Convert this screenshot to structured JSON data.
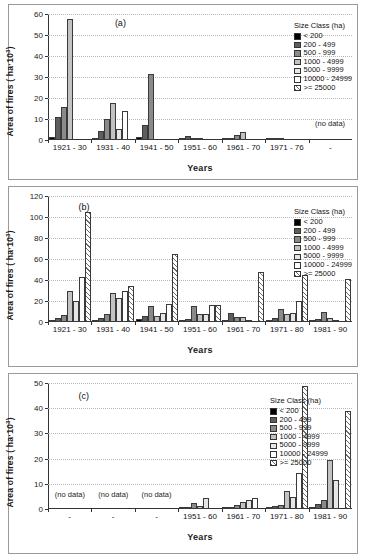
{
  "figure": {
    "xlabel": "Years",
    "ylabel_prefix": "Area of fires ( ha",
    "ylabel_mid": "·10",
    "ylabel_exp": "3",
    "ylabel_suffix": ")",
    "legend_title": "Size Class (ha)",
    "no_data_label": "(no data)",
    "dash_label": "-"
  },
  "size_classes": [
    {
      "label": "< 200",
      "fill": "f0",
      "color": "#000000"
    },
    {
      "label": "200 - 499",
      "fill": "f1",
      "color": "#5e5e5e"
    },
    {
      "label": "500 - 999",
      "fill": "f2",
      "color": "#8a8a8a"
    },
    {
      "label": "1000 - 4999",
      "fill": "f3",
      "color": "#c2c2c2"
    },
    {
      "label": "5000 - 9999",
      "fill": "f4",
      "color": "#e6e6e6"
    },
    {
      "label": "10000 - 24999",
      "fill": "f5",
      "color": "#ffffff"
    },
    {
      "label": ">= 25000",
      "fill": "f6",
      "color": "#ffffff"
    }
  ],
  "chart_data": [
    {
      "type": "bar",
      "panel": "(a)",
      "title": "(a)",
      "xlabel": "Years",
      "ylabel": "Area of fires ( ha·10³)",
      "ylim": [
        0,
        60
      ],
      "yticks": [
        0,
        10,
        20,
        30,
        40,
        50,
        60
      ],
      "grid": true,
      "legend_position": "top-right",
      "categories": [
        "1921 - 30",
        "1931 - 40",
        "1941 - 50",
        "1951 - 60",
        "1961 - 70",
        "1971 - 76",
        "-"
      ],
      "no_data_categories": [
        "-"
      ],
      "series": [
        {
          "name": "< 200",
          "values": [
            1.3,
            1.0,
            1.6,
            0.3,
            0.5,
            0.3,
            null
          ]
        },
        {
          "name": "200 - 499",
          "values": [
            11.0,
            4.5,
            7.0,
            1.9,
            1.0,
            0.5,
            null
          ]
        },
        {
          "name": "500 - 999",
          "values": [
            15.8,
            10.0,
            31.3,
            1.0,
            2.3,
            1.0,
            null
          ]
        },
        {
          "name": "1000 - 4999",
          "values": [
            57.5,
            17.8,
            0,
            0.3,
            3.8,
            0,
            null
          ]
        },
        {
          "name": "5000 - 9999",
          "values": [
            0,
            5.2,
            0,
            0,
            0,
            0,
            null
          ]
        },
        {
          "name": "10000 - 24999",
          "values": [
            0,
            13.8,
            0,
            0,
            0,
            0,
            null
          ]
        },
        {
          "name": ">= 25000",
          "values": [
            0,
            0,
            0,
            0,
            0,
            0,
            null
          ]
        }
      ]
    },
    {
      "type": "bar",
      "panel": "(b)",
      "title": "(b)",
      "xlabel": "Years",
      "ylabel": "Area of fires ( ha·10³)",
      "ylim": [
        0,
        120
      ],
      "yticks": [
        0,
        20,
        40,
        60,
        80,
        100,
        120
      ],
      "grid": true,
      "legend_position": "top-right",
      "categories": [
        "1921 - 30",
        "1931 - 40",
        "1941 - 50",
        "1951 - 60",
        "1961 - 70",
        "1971 - 80",
        "1981 - 90"
      ],
      "no_data_categories": [],
      "series": [
        {
          "name": "< 200",
          "values": [
            1.2,
            1.3,
            2.8,
            1.7,
            0.8,
            1.6,
            1.3
          ]
        },
        {
          "name": "200 - 499",
          "values": [
            3.6,
            4.0,
            5.5,
            3.3,
            8.5,
            3.8,
            3.2
          ]
        },
        {
          "name": "500 - 999",
          "values": [
            6.8,
            7.8,
            14.8,
            15.3,
            5.0,
            12.5,
            10.0
          ]
        },
        {
          "name": "1000 - 4999",
          "values": [
            30.0,
            27.8,
            5.5,
            7.5,
            4.8,
            7.6,
            3.5
          ]
        },
        {
          "name": "5000 - 9999",
          "values": [
            19.8,
            22.8,
            9.0,
            7.5,
            2.2,
            8.2,
            1.5
          ]
        },
        {
          "name": "10000 - 24999",
          "values": [
            42.8,
            29.8,
            16.8,
            16.3,
            0,
            19.8,
            0
          ]
        },
        {
          "name": ">= 25000",
          "values": [
            104.5,
            34.0,
            65.0,
            16.5,
            47.3,
            45.0,
            40.5
          ]
        }
      ]
    },
    {
      "type": "bar",
      "panel": "(c)",
      "title": "(c)",
      "xlabel": "Years",
      "ylabel": "Area of fires ( ha·10³)",
      "ylim": [
        0,
        50
      ],
      "yticks": [
        0,
        10,
        20,
        30,
        40,
        50
      ],
      "grid": true,
      "legend_position": "top-right",
      "categories": [
        "-",
        "-",
        "-",
        "1951 - 60",
        "1961 - 70",
        "1971 - 80",
        "1981 - 90"
      ],
      "no_data_categories": [
        "-",
        "-",
        "-"
      ],
      "series": [
        {
          "name": "< 200",
          "values": [
            null,
            null,
            null,
            0.2,
            0.3,
            0.8,
            0.4
          ]
        },
        {
          "name": "200 - 499",
          "values": [
            null,
            null,
            null,
            0.6,
            0.5,
            1.3,
            2.0
          ]
        },
        {
          "name": "500 - 999",
          "values": [
            null,
            null,
            null,
            2.3,
            1.5,
            1.4,
            3.4
          ]
        },
        {
          "name": "1000 - 4999",
          "values": [
            null,
            null,
            null,
            1.2,
            2.7,
            7.2,
            19.3
          ]
        },
        {
          "name": "5000 - 9999",
          "values": [
            null,
            null,
            null,
            4.3,
            3.6,
            4.8,
            11.5
          ]
        },
        {
          "name": "10000 - 24999",
          "values": [
            null,
            null,
            null,
            0,
            4.5,
            14.2,
            0
          ]
        },
        {
          "name": ">= 25000",
          "values": [
            null,
            null,
            null,
            0,
            0,
            48.8,
            38.8
          ]
        }
      ]
    }
  ]
}
